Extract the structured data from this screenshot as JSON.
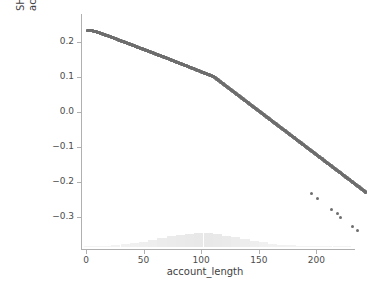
{
  "figure": {
    "background_color": "#ffffff",
    "point_color": "#6e6e6e",
    "rug_color": "#e8e8e8",
    "axis_color": "#b0b0b0",
    "text_color": "#3f3f3f"
  },
  "axes": {
    "x_title": "account_length",
    "y_title_line1": "SHAP value for",
    "y_title_line2": "account_length",
    "x_ticks": [
      {
        "value": 0,
        "label": "0"
      },
      {
        "value": 50,
        "label": "50"
      },
      {
        "value": 100,
        "label": "100"
      },
      {
        "value": 150,
        "label": "150"
      },
      {
        "value": 200,
        "label": "200"
      }
    ],
    "y_ticks": [
      {
        "value": 0.2,
        "label": "0.2"
      },
      {
        "value": 0.1,
        "label": "0.1"
      },
      {
        "value": 0.0,
        "label": "0.0"
      },
      {
        "value": -0.1,
        "label": "−0.1"
      },
      {
        "value": -0.2,
        "label": "−0.2"
      },
      {
        "value": -0.3,
        "label": "−0.3"
      }
    ]
  },
  "chart_data": {
    "type": "scatter",
    "title": "",
    "xlabel": "account_length",
    "ylabel": "SHAP value for account_length",
    "xlim": [
      -8,
      248
    ],
    "ylim": [
      -0.36,
      0.26
    ],
    "grid": false,
    "legend": null,
    "marker_size": 3,
    "marker_color": "#6e6e6e",
    "relationship": "strictly decreasing, near-linear",
    "fit_line": {
      "slope": -0.00243,
      "intercept": 0.2355
    },
    "points": [
      {
        "x": 1,
        "y": 0.2335
      },
      {
        "x": 3,
        "y": 0.233
      },
      {
        "x": 5,
        "y": 0.2318
      },
      {
        "x": 7,
        "y": 0.23
      },
      {
        "x": 9,
        "y": 0.2282
      },
      {
        "x": 11,
        "y": 0.2262
      },
      {
        "x": 13,
        "y": 0.224
      },
      {
        "x": 15,
        "y": 0.2215
      },
      {
        "x": 17,
        "y": 0.219
      },
      {
        "x": 19,
        "y": 0.2168
      },
      {
        "x": 21,
        "y": 0.2145
      },
      {
        "x": 23,
        "y": 0.212
      },
      {
        "x": 25,
        "y": 0.2095
      },
      {
        "x": 27,
        "y": 0.207
      },
      {
        "x": 29,
        "y": 0.2045
      },
      {
        "x": 31,
        "y": 0.202
      },
      {
        "x": 33,
        "y": 0.1995
      },
      {
        "x": 35,
        "y": 0.197
      },
      {
        "x": 37,
        "y": 0.1945
      },
      {
        "x": 39,
        "y": 0.192
      },
      {
        "x": 41,
        "y": 0.1895
      },
      {
        "x": 43,
        "y": 0.187
      },
      {
        "x": 45,
        "y": 0.1845
      },
      {
        "x": 47,
        "y": 0.182
      },
      {
        "x": 49,
        "y": 0.1795
      },
      {
        "x": 51,
        "y": 0.177
      },
      {
        "x": 53,
        "y": 0.1745
      },
      {
        "x": 55,
        "y": 0.172
      },
      {
        "x": 57,
        "y": 0.1695
      },
      {
        "x": 59,
        "y": 0.167
      },
      {
        "x": 61,
        "y": 0.1645
      },
      {
        "x": 63,
        "y": 0.162
      },
      {
        "x": 65,
        "y": 0.1595
      },
      {
        "x": 67,
        "y": 0.157
      },
      {
        "x": 69,
        "y": 0.1545
      },
      {
        "x": 71,
        "y": 0.152
      },
      {
        "x": 73,
        "y": 0.1495
      },
      {
        "x": 75,
        "y": 0.1468
      },
      {
        "x": 77,
        "y": 0.1442
      },
      {
        "x": 79,
        "y": 0.1416
      },
      {
        "x": 81,
        "y": 0.139
      },
      {
        "x": 83,
        "y": 0.1364
      },
      {
        "x": 85,
        "y": 0.1338
      },
      {
        "x": 87,
        "y": 0.1312
      },
      {
        "x": 89,
        "y": 0.1286
      },
      {
        "x": 91,
        "y": 0.126
      },
      {
        "x": 93,
        "y": 0.1234
      },
      {
        "x": 95,
        "y": 0.1208
      },
      {
        "x": 97,
        "y": 0.1182
      },
      {
        "x": 99,
        "y": 0.1156
      },
      {
        "x": 101,
        "y": 0.113
      },
      {
        "x": 103,
        "y": 0.1104
      },
      {
        "x": 105,
        "y": 0.1078
      },
      {
        "x": 107,
        "y": 0.1052
      },
      {
        "x": 109,
        "y": 0.1026
      },
      {
        "x": 111,
        "y": 0.1
      },
      {
        "x": 113,
        "y": 0.095
      },
      {
        "x": 115,
        "y": 0.09
      },
      {
        "x": 117,
        "y": 0.085
      },
      {
        "x": 119,
        "y": 0.08
      },
      {
        "x": 121,
        "y": 0.075
      },
      {
        "x": 123,
        "y": 0.07
      },
      {
        "x": 125,
        "y": 0.065
      },
      {
        "x": 127,
        "y": 0.06
      },
      {
        "x": 129,
        "y": 0.055
      },
      {
        "x": 131,
        "y": 0.05
      },
      {
        "x": 133,
        "y": 0.045
      },
      {
        "x": 135,
        "y": 0.04
      },
      {
        "x": 137,
        "y": 0.035
      },
      {
        "x": 139,
        "y": 0.03
      },
      {
        "x": 141,
        "y": 0.025
      },
      {
        "x": 143,
        "y": 0.02
      },
      {
        "x": 145,
        "y": 0.015
      },
      {
        "x": 147,
        "y": 0.01
      },
      {
        "x": 149,
        "y": 0.005
      },
      {
        "x": 151,
        "y": 0.0
      },
      {
        "x": 153,
        "y": -0.005
      },
      {
        "x": 155,
        "y": -0.01
      },
      {
        "x": 157,
        "y": -0.015
      },
      {
        "x": 159,
        "y": -0.02
      },
      {
        "x": 161,
        "y": -0.025
      },
      {
        "x": 163,
        "y": -0.03
      },
      {
        "x": 165,
        "y": -0.035
      },
      {
        "x": 167,
        "y": -0.04
      },
      {
        "x": 169,
        "y": -0.045
      },
      {
        "x": 171,
        "y": -0.05
      },
      {
        "x": 173,
        "y": -0.055
      },
      {
        "x": 175,
        "y": -0.06
      },
      {
        "x": 177,
        "y": -0.065
      },
      {
        "x": 179,
        "y": -0.07
      },
      {
        "x": 181,
        "y": -0.075
      },
      {
        "x": 183,
        "y": -0.08
      },
      {
        "x": 185,
        "y": -0.085
      },
      {
        "x": 187,
        "y": -0.09
      },
      {
        "x": 189,
        "y": -0.095
      },
      {
        "x": 191,
        "y": -0.1
      },
      {
        "x": 193,
        "y": -0.105
      },
      {
        "x": 195,
        "y": -0.11
      },
      {
        "x": 197,
        "y": -0.115
      },
      {
        "x": 199,
        "y": -0.12
      },
      {
        "x": 201,
        "y": -0.125
      },
      {
        "x": 203,
        "y": -0.13
      },
      {
        "x": 205,
        "y": -0.135
      },
      {
        "x": 207,
        "y": -0.14
      },
      {
        "x": 209,
        "y": -0.145
      },
      {
        "x": 211,
        "y": -0.15
      },
      {
        "x": 213,
        "y": -0.155
      },
      {
        "x": 215,
        "y": -0.16
      },
      {
        "x": 217,
        "y": -0.165
      },
      {
        "x": 219,
        "y": -0.17
      },
      {
        "x": 221,
        "y": -0.175
      },
      {
        "x": 223,
        "y": -0.18
      },
      {
        "x": 225,
        "y": -0.185
      },
      {
        "x": 227,
        "y": -0.19
      },
      {
        "x": 229,
        "y": -0.195
      },
      {
        "x": 231,
        "y": -0.2
      },
      {
        "x": 233,
        "y": -0.205
      },
      {
        "x": 235,
        "y": -0.21
      },
      {
        "x": 237,
        "y": -0.215
      },
      {
        "x": 239,
        "y": -0.22
      },
      {
        "x": 241,
        "y": -0.225
      },
      {
        "x": 243,
        "y": -0.23
      }
    ],
    "outlier_points": [
      {
        "x": 196,
        "y": -0.2345
      },
      {
        "x": 201,
        "y": -0.249
      },
      {
        "x": 213,
        "y": -0.279
      },
      {
        "x": 218,
        "y": -0.29
      },
      {
        "x": 221,
        "y": -0.302
      },
      {
        "x": 231,
        "y": -0.328
      },
      {
        "x": 236,
        "y": -0.339
      }
    ],
    "rug_histogram": {
      "description": "light gray density strip of account_length values along bottom",
      "color": "#e8e8e8",
      "bins": [
        {
          "x": 2,
          "count": 1
        },
        {
          "x": 10,
          "count": 2
        },
        {
          "x": 18,
          "count": 4
        },
        {
          "x": 26,
          "count": 7
        },
        {
          "x": 34,
          "count": 11
        },
        {
          "x": 42,
          "count": 16
        },
        {
          "x": 50,
          "count": 22
        },
        {
          "x": 58,
          "count": 29
        },
        {
          "x": 66,
          "count": 36
        },
        {
          "x": 74,
          "count": 43
        },
        {
          "x": 82,
          "count": 49
        },
        {
          "x": 90,
          "count": 54
        },
        {
          "x": 98,
          "count": 57
        },
        {
          "x": 106,
          "count": 56
        },
        {
          "x": 114,
          "count": 52
        },
        {
          "x": 122,
          "count": 46
        },
        {
          "x": 130,
          "count": 39
        },
        {
          "x": 138,
          "count": 32
        },
        {
          "x": 146,
          "count": 25
        },
        {
          "x": 154,
          "count": 19
        },
        {
          "x": 162,
          "count": 14
        },
        {
          "x": 170,
          "count": 10
        },
        {
          "x": 178,
          "count": 7
        },
        {
          "x": 186,
          "count": 4
        },
        {
          "x": 194,
          "count": 3
        },
        {
          "x": 202,
          "count": 2
        },
        {
          "x": 210,
          "count": 1
        },
        {
          "x": 218,
          "count": 1
        },
        {
          "x": 226,
          "count": 1
        }
      ]
    }
  }
}
